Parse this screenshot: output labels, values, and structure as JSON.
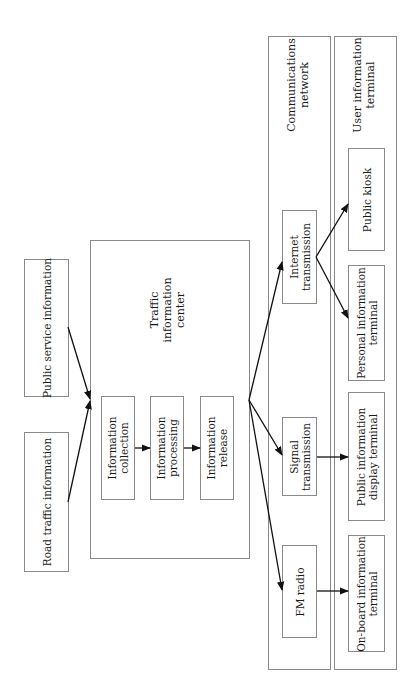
{
  "diagram": {
    "type": "flowchart",
    "orientation": "rotated-90-ccw",
    "sources": [
      {
        "id": "public-service",
        "label": "Public service information"
      },
      {
        "id": "road-traffic",
        "label": "Road traffic information"
      }
    ],
    "center": {
      "title": "Traffic\ninformation\ncenter",
      "title_lines": [
        "Traffic",
        "information",
        "center"
      ],
      "steps": [
        {
          "id": "collection",
          "lines": [
            "Information",
            "collection"
          ]
        },
        {
          "id": "processing",
          "lines": [
            "Information",
            "processing"
          ]
        },
        {
          "id": "release",
          "lines": [
            "Information",
            "release"
          ]
        }
      ]
    },
    "network": {
      "title_lines": [
        "Communications",
        "network"
      ],
      "channels": [
        {
          "id": "internet",
          "lines": [
            "Internet",
            "transmission"
          ]
        },
        {
          "id": "signal",
          "lines": [
            "Signal",
            "transmission"
          ]
        },
        {
          "id": "fm",
          "lines": [
            "FM radio"
          ]
        }
      ]
    },
    "terminals": {
      "title_lines": [
        "User information",
        "terminal"
      ],
      "items": [
        {
          "id": "kiosk",
          "lines": [
            "Public kiosk"
          ]
        },
        {
          "id": "personal",
          "lines": [
            "Personal information",
            "terminal"
          ]
        },
        {
          "id": "display",
          "lines": [
            "Public information",
            "display terminal"
          ]
        },
        {
          "id": "onboard",
          "lines": [
            "On-board information",
            "terminal"
          ]
        }
      ]
    },
    "edges": [
      [
        "Public service information",
        "Traffic information center"
      ],
      [
        "Road traffic information",
        "Traffic information center"
      ],
      [
        "Information collection",
        "Information processing"
      ],
      [
        "Information processing",
        "Information release"
      ],
      [
        "Traffic information center",
        "Internet transmission"
      ],
      [
        "Traffic information center",
        "Signal transmission"
      ],
      [
        "Traffic information center",
        "FM radio"
      ],
      [
        "Internet transmission",
        "Public kiosk"
      ],
      [
        "Internet transmission",
        "Personal information terminal"
      ],
      [
        "Signal transmission",
        "Public information display terminal"
      ],
      [
        "FM radio",
        "On-board information terminal"
      ]
    ]
  }
}
